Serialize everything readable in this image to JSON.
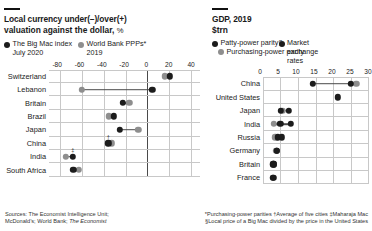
{
  "left": {
    "title": "Local currency under(–)/over(+)",
    "subtitle_main": "valuation against the dollar,",
    "subtitle_units": "%",
    "legend": [
      {
        "label": "The Big Mac index",
        "sub": "July 2020",
        "color": "#1c1c1c",
        "marker": "dot-dark"
      },
      {
        "label": "World Bank PPPs*",
        "sub": "2019",
        "color": "#8e8e8e",
        "marker": "dot-grey"
      }
    ],
    "categories": [
      "Switzerland",
      "Lebanon",
      "Britain",
      "Brazil",
      "Japan",
      "China",
      "India",
      "South Africa"
    ],
    "ticks": [
      -80,
      -60,
      -40,
      -20,
      0,
      20,
      40
    ],
    "markers": [
      {
        "category": "China",
        "symbol": "†"
      },
      {
        "category": "India",
        "symbol": "‡"
      }
    ]
  },
  "right": {
    "title": "GDP, 2019",
    "subtitle_main": "$trn",
    "subtitle_units": "",
    "legend": [
      {
        "label": "Patty-power parity§",
        "color": "#1c1c1c",
        "marker": "dot-dark"
      },
      {
        "label": "Purchasing-power parity",
        "color": "#8e8e8e",
        "marker": "dot-grey"
      },
      {
        "label": "Market exchange rates",
        "color": "#1c1c1c",
        "marker": "dot-dark"
      }
    ],
    "categories": [
      "China",
      "United States",
      "Japan",
      "India",
      "Russia",
      "Germany",
      "Britain",
      "France"
    ],
    "ticks": [
      0,
      5,
      10,
      15,
      20,
      25,
      30
    ]
  },
  "footnotes": {
    "sources_label": "Sources:",
    "sources_line1": "The Economist Intelligence Unit;",
    "sources_line2_a": "McDonald’s; World Bank;",
    "sources_line2_b": "The Economist",
    "notes_line1": "*Purchasing-power parities  †Average of five cities  ‡Maharaja Mac",
    "notes_line2": "§Local price of a Big Mac divided by the price in the United States"
  },
  "chart_data": [
    {
      "type": "scatter",
      "title": "Local currency under(–)/over(+) valuation against the dollar, %",
      "xlabel": "%",
      "ylabel": "",
      "xlim": [
        -90,
        48
      ],
      "grid": true,
      "legend_position": "top",
      "categories": [
        "Switzerland",
        "Lebanon",
        "Britain",
        "Brazil",
        "Japan",
        "China",
        "India",
        "South Africa"
      ],
      "series": [
        {
          "name": "The Big Mac index July 2020",
          "color": "#1c1c1c",
          "values": [
            20.2,
            4.3,
            -22.5,
            -30.5,
            -25.4,
            -35.8,
            -68.2,
            -67.7
          ]
        },
        {
          "name": "World Bank PPPs* 2019",
          "color": "#8e8e8e",
          "values": [
            16.0,
            -60.0,
            -16.7,
            -35.6,
            -8.3,
            -32.8,
            -74.6,
            -63.0
          ]
        }
      ]
    },
    {
      "type": "scatter",
      "title": "GDP, 2019",
      "xlabel": "$trn",
      "ylabel": "",
      "xlim": [
        0,
        30
      ],
      "grid": true,
      "legend_position": "top",
      "categories": [
        "China",
        "United States",
        "Japan",
        "India",
        "Russia",
        "Germany",
        "Britain",
        "France"
      ],
      "series": [
        {
          "name": "Patty-power parity§",
          "color": "#1c1c1c",
          "values": [
            14.2,
            null,
            7.4,
            5.0,
            5.3,
            4.0,
            3.1,
            3.0
          ]
        },
        {
          "name": "Purchasing-power parity",
          "color": "#8e8e8e",
          "values": [
            26.7,
            null,
            5.6,
            3.1,
            3.5,
            3.8,
            2.9,
            2.8
          ]
        },
        {
          "name": "Market exchange rates",
          "color": "#1c1c1c",
          "values": [
            25.0,
            21.4,
            5.1,
            8.0,
            4.2,
            3.9,
            2.9,
            2.8
          ]
        }
      ]
    }
  ]
}
